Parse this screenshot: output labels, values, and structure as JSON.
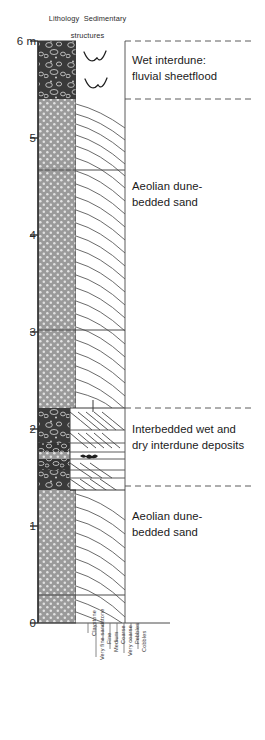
{
  "figure": {
    "type": "stratigraphic-log",
    "headers": {
      "lithology": "Lithology",
      "sedimentary_structures_line1": "Sedimentary",
      "sedimentary_structures_line2": "structures"
    },
    "depth_axis": {
      "unit": "m",
      "top_label": "6 m",
      "ticks": [
        {
          "value": 6,
          "label": "6 m",
          "y": 41
        },
        {
          "value": 5,
          "label": "5",
          "y": 138
        },
        {
          "value": 4,
          "label": "4",
          "y": 235
        },
        {
          "value": 3,
          "label": "3",
          "y": 332
        },
        {
          "value": 2,
          "label": "2",
          "y": 429
        },
        {
          "value": 1,
          "label": "1",
          "y": 526
        },
        {
          "value": 0,
          "label": "0",
          "y": 623
        }
      ],
      "range": [
        0,
        6
      ]
    },
    "grain_size_axis": {
      "labels": [
        {
          "text": "Claystone",
          "x": 88,
          "tick_len": 10
        },
        {
          "text": "Very fine sandstone",
          "x": 96,
          "tick_len": 34
        },
        {
          "text": "Fine",
          "x": 103,
          "tick_len": 18
        },
        {
          "text": "Medium",
          "x": 110,
          "tick_len": 26
        },
        {
          "text": "Coarse",
          "x": 117,
          "tick_len": 18
        },
        {
          "text": "Very coarse",
          "x": 124,
          "tick_len": 30
        },
        {
          "text": "Pebbles",
          "x": 131,
          "tick_len": 18
        },
        {
          "text": "Cobbles",
          "x": 138,
          "tick_len": 26
        }
      ]
    },
    "facies_notes": [
      {
        "text": "Wet interdune:\nfluvial sheetflood",
        "top": 52,
        "left": 132
      },
      {
        "text": "Aeolian dune-\nbedded sand",
        "top": 178,
        "left": 132
      },
      {
        "text": "Interbedded wet and\ndry interdune deposits",
        "top": 421,
        "left": 132
      },
      {
        "text": "Aeolian dune-\nbedded sand",
        "top": 508,
        "left": 132
      }
    ],
    "lithology_units": [
      {
        "top": 41,
        "bottom": 99,
        "lithology": "conglomerate",
        "width": 38,
        "structure": "scour-fills"
      },
      {
        "top": 99,
        "bottom": 170,
        "lithology": "sandstone",
        "width": 38,
        "structure": "cross-bedding"
      },
      {
        "top": 170,
        "bottom": 330,
        "lithology": "sandstone",
        "width": 38,
        "structure": "cross-bedding"
      },
      {
        "top": 330,
        "bottom": 408,
        "lithology": "sandstone",
        "width": 38,
        "structure": "cross-bedding"
      },
      {
        "top": 408,
        "bottom": 432,
        "lithology": "conglomerate",
        "width": 32,
        "structure": "cross-bedding"
      },
      {
        "top": 432,
        "bottom": 443,
        "lithology": "conglomerate",
        "width": 32,
        "structure": "cross-bedding"
      },
      {
        "top": 443,
        "bottom": 452,
        "lithology": "conglomerate",
        "width": 32,
        "structure": "planar"
      },
      {
        "top": 452,
        "bottom": 459,
        "lithology": "sandstone",
        "width": 32,
        "structure": "planar"
      },
      {
        "top": 459,
        "bottom": 470,
        "lithology": "conglomerate",
        "width": 32,
        "structure": "ripple"
      },
      {
        "top": 470,
        "bottom": 478,
        "lithology": "conglomerate",
        "width": 32,
        "structure": "planar"
      },
      {
        "top": 478,
        "bottom": 490,
        "lithology": "conglomerate",
        "width": 32,
        "structure": "cross-bedding"
      },
      {
        "top": 490,
        "bottom": 595,
        "lithology": "sandstone",
        "width": 38,
        "structure": "cross-bedding"
      },
      {
        "top": 595,
        "bottom": 623,
        "lithology": "sandstone",
        "width": 38,
        "structure": "cross-bedding"
      }
    ],
    "boundaries": {
      "dashed_leader_y": [
        41,
        99,
        408,
        486
      ],
      "internal_solid_y": [
        170,
        330,
        595
      ]
    },
    "colors": {
      "conglomerate_fill": "#3c3c3c",
      "sandstone_fill": "#999999",
      "line": "#4a4a4a",
      "text": "#1a1a1a",
      "axis": "#3a3a3a"
    }
  }
}
